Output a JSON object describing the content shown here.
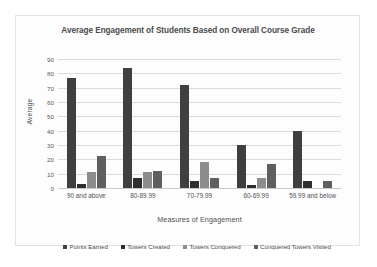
{
  "chart_data": {
    "type": "bar",
    "title": "Average Engagement of Students Based on Overall Course Grade",
    "xlabel": "Measures of Engagement",
    "ylabel": "Average",
    "ylim": [
      0,
      90
    ],
    "ytick_step": 10,
    "yticks": [
      90,
      80,
      70,
      60,
      50,
      40,
      30,
      20,
      10,
      0
    ],
    "grid": true,
    "legend_position": "bottom",
    "categories": [
      "90 and above",
      "80-89.99",
      "70-79.99",
      "60-69.99",
      "59.99 and below"
    ],
    "series": [
      {
        "name": "Points Earned",
        "color": "#3f3f3f",
        "values": [
          77,
          84,
          72,
          30,
          40
        ]
      },
      {
        "name": "Towers Created",
        "color": "#2e2e2e",
        "values": [
          3,
          7,
          5,
          2,
          5
        ]
      },
      {
        "name": "Towers Conquered",
        "color": "#8d8d8d",
        "values": [
          11,
          11,
          18,
          7,
          0
        ]
      },
      {
        "name": "Conquered Towers Visited",
        "color": "#5f5f5f",
        "values": [
          22,
          12,
          7,
          17,
          5
        ]
      }
    ]
  },
  "colors": {
    "frame_border": "#e2e2e2",
    "gridline": "#dcdcdc",
    "plot_background": "#fdfdfd",
    "title_text": "#4a4a4a",
    "axis_text": "#545454"
  }
}
